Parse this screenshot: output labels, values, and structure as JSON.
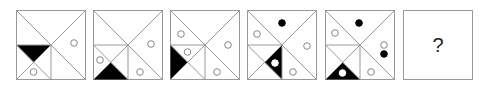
{
  "puzzle": {
    "type": "figure-sequence",
    "line_color": "#999999",
    "fill_color": "#000000",
    "panels": [
      {
        "index": 1,
        "x": 16,
        "black_triangle": "lower-left-subsquare-top",
        "black_triangle_has_white_circle": false,
        "circles": [
          {
            "region": "lower-left-subsquare-bottom",
            "fill": "white",
            "cx": 17.5,
            "cy": 62
          },
          {
            "region": "right-triangle",
            "fill": "white",
            "cx": 58,
            "cy": 33
          }
        ]
      },
      {
        "index": 2,
        "x": 93,
        "black_triangle": "lower-left-subsquare-bottom",
        "black_triangle_has_white_circle": false,
        "circles": [
          {
            "region": "lower-left-subsquare-left",
            "fill": "white",
            "cx": 7,
            "cy": 50
          },
          {
            "region": "bottom-right",
            "fill": "white",
            "cx": 47,
            "cy": 62
          },
          {
            "region": "right-triangle",
            "fill": "white",
            "cx": 58,
            "cy": 34
          }
        ]
      },
      {
        "index": 3,
        "x": 170,
        "black_triangle": "lower-left-subsquare-left",
        "black_triangle_has_white_circle": false,
        "circles": [
          {
            "region": "left-triangle-upper",
            "fill": "white",
            "cx": 11,
            "cy": 24
          },
          {
            "region": "lower-left-subsquare-top",
            "fill": "white",
            "cx": 17.5,
            "cy": 42
          },
          {
            "region": "right-triangle",
            "fill": "white",
            "cx": 58,
            "cy": 35
          },
          {
            "region": "bottom-right",
            "fill": "white",
            "cx": 47,
            "cy": 62
          }
        ]
      },
      {
        "index": 4,
        "x": 247,
        "black_triangle": "lower-left-subsquare-right",
        "black_triangle_has_white_circle": true,
        "circles": [
          {
            "region": "top-triangle",
            "fill": "black",
            "cx": 35,
            "cy": 13
          },
          {
            "region": "left-triangle-upper",
            "fill": "white",
            "cx": 10,
            "cy": 24
          },
          {
            "region": "lower-left-subsquare-right",
            "fill": "white",
            "cx": 28,
            "cy": 53
          },
          {
            "region": "right-triangle",
            "fill": "white",
            "cx": 60,
            "cy": 36
          },
          {
            "region": "bottom-right",
            "fill": "white",
            "cx": 46,
            "cy": 62
          }
        ]
      },
      {
        "index": 5,
        "x": 325,
        "black_triangle": "lower-left-subsquare-bottom",
        "black_triangle_has_white_circle": true,
        "circles": [
          {
            "region": "top-triangle",
            "fill": "black",
            "cx": 34,
            "cy": 13
          },
          {
            "region": "left-triangle-upper",
            "fill": "white",
            "cx": 10,
            "cy": 23
          },
          {
            "region": "right-triangle",
            "fill": "white",
            "cx": 59,
            "cy": 35
          },
          {
            "region": "right-triangle",
            "fill": "black",
            "cx": 59,
            "cy": 44
          },
          {
            "region": "lower-left-subsquare-bottom",
            "fill": "white",
            "cx": 17.5,
            "cy": 63
          },
          {
            "region": "bottom-right",
            "fill": "white",
            "cx": 46,
            "cy": 62
          }
        ]
      },
      {
        "index": 6,
        "x": 403,
        "question_mark": "?"
      }
    ]
  }
}
